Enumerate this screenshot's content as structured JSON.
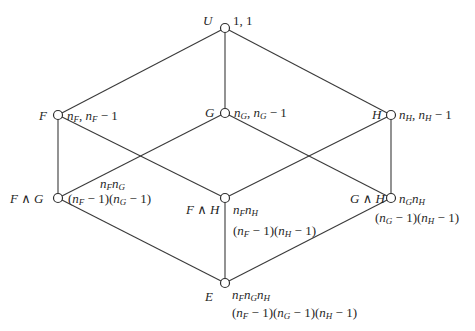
{
  "nodes": [
    {
      "id": "U",
      "name": "U",
      "x": 225,
      "y": 28,
      "annotation": [
        "1, 1"
      ]
    },
    {
      "id": "F",
      "name": "F",
      "x": 58,
      "y": 115,
      "annotation": [
        "n_F, n_F − 1"
      ]
    },
    {
      "id": "G",
      "name": "G",
      "x": 225,
      "y": 113,
      "annotation": [
        "n_G, n_G − 1"
      ]
    },
    {
      "id": "H",
      "name": "H",
      "x": 391,
      "y": 115,
      "annotation": [
        "n_H, n_H − 1"
      ]
    },
    {
      "id": "FG",
      "name": "F ∧ G",
      "x": 58,
      "y": 198,
      "annotation": [
        "n_F n_G",
        "(n_F − 1)(n_G − 1)"
      ]
    },
    {
      "id": "FH",
      "name": "F ∧ H",
      "x": 225,
      "y": 198,
      "annotation": [
        "n_F n_H",
        "(n_F − 1)(n_H − 1)"
      ]
    },
    {
      "id": "GH",
      "name": "G ∧ H",
      "x": 391,
      "y": 198,
      "annotation": [
        "n_G n_H",
        "(n_G − 1)(n_H − 1)"
      ]
    },
    {
      "id": "E",
      "name": "E",
      "x": 225,
      "y": 283,
      "annotation": [
        "n_F n_G n_H",
        "(n_F − 1)(n_G − 1)(n_H − 1)"
      ]
    }
  ],
  "edges": [
    [
      "U",
      "F"
    ],
    [
      "U",
      "G"
    ],
    [
      "U",
      "H"
    ],
    [
      "F",
      "FG"
    ],
    [
      "F",
      "FH"
    ],
    [
      "G",
      "FG"
    ],
    [
      "G",
      "GH"
    ],
    [
      "H",
      "FH"
    ],
    [
      "H",
      "GH"
    ],
    [
      "FG",
      "E"
    ],
    [
      "FH",
      "E"
    ],
    [
      "GH",
      "E"
    ]
  ],
  "labels": {
    "U": {
      "name": "U",
      "ann": "1, 1"
    },
    "F": {
      "name": "F"
    },
    "G": {
      "name": "G"
    },
    "H": {
      "name": "H"
    },
    "FG": {
      "name": "F ∧ G"
    },
    "FH": {
      "name": "F ∧ H"
    },
    "GH": {
      "name": "G ∧ H"
    },
    "E": {
      "name": "E"
    }
  },
  "colors": {
    "line": "#3a3a3a",
    "text": "#1f1f1f",
    "background": "#ffffff"
  }
}
